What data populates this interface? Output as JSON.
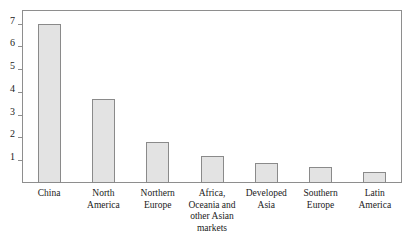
{
  "figure": {
    "caption_remnant": "",
    "background_color": "#ffffff",
    "frame_color": "#8e8e8e",
    "bar_fill_color": "#e3e3e3",
    "bar_edge_color": "#8a8a8a"
  },
  "chart_data": {
    "type": "bar",
    "title": "",
    "xlabel": "",
    "ylabel": "",
    "ylim": [
      0,
      7.6
    ],
    "grid": false,
    "legend": false,
    "y_ticks": [
      1,
      2,
      3,
      4,
      5,
      6,
      7
    ],
    "y_tick_labels": [
      "1",
      "2",
      "3",
      "4",
      "5",
      "6",
      "7"
    ],
    "categories": [
      "China",
      "North America",
      "Northern Europe",
      "Africa, Oceania and other Asian markets",
      "Developed Asia",
      "Southern Europe",
      "Latin America"
    ],
    "category_lines": [
      [
        "China"
      ],
      [
        "North",
        "America"
      ],
      [
        "Northern",
        "Europe"
      ],
      [
        "Africa,",
        "Oceania and",
        "other Asian",
        "markets"
      ],
      [
        "Developed",
        "Asia"
      ],
      [
        "Southern",
        "Europe"
      ],
      [
        "Latin",
        "America"
      ]
    ],
    "values": [
      7.0,
      3.7,
      1.8,
      1.2,
      0.9,
      0.7,
      0.5
    ]
  }
}
